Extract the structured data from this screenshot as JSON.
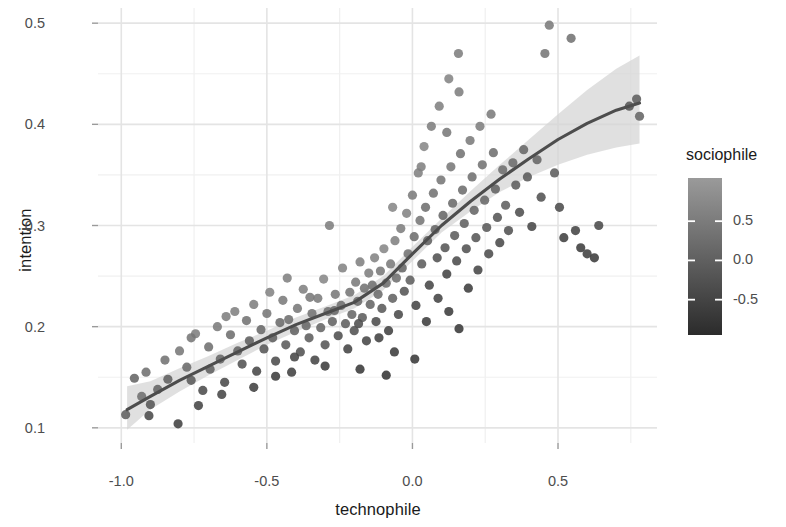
{
  "chart_data": {
    "type": "scatter",
    "title": "",
    "xlabel": "technophile",
    "ylabel": "intention",
    "xlim": [
      -1.08,
      0.84
    ],
    "ylim": [
      0.085,
      0.515
    ],
    "grid": true,
    "x_ticks": [
      -1.0,
      -0.5,
      0.0,
      0.5
    ],
    "x_tick_labels": [
      "-1.0",
      "-0.5",
      "0.0",
      "0.5"
    ],
    "y_ticks": [
      0.1,
      0.2,
      0.3,
      0.4,
      0.5
    ],
    "y_tick_labels": [
      "0.1",
      "0.2",
      "0.3",
      "0.4",
      "0.5"
    ],
    "x_minor_ticks": [
      -0.75,
      -0.25,
      0.25,
      0.75
    ],
    "y_minor_ticks": [
      0.15,
      0.25,
      0.35,
      0.45
    ],
    "legend": {
      "title": "sociophile",
      "position": "right",
      "type": "colorbar",
      "ticks": [
        0.5,
        0.0,
        -0.5
      ],
      "tick_labels": [
        "0.5",
        "0.0",
        "-0.5"
      ],
      "range": [
        -0.95,
        1.05
      ],
      "color_low": "#2b2b2b",
      "color_high": "#9a9a9a"
    },
    "point_color_default": "#6e6e6e",
    "trend_line_color": "#4d4d4d",
    "confidence_band_color": "#d4d4d4",
    "trend_line": {
      "x": [
        -0.98,
        -0.9,
        -0.8,
        -0.7,
        -0.6,
        -0.5,
        -0.4,
        -0.3,
        -0.2,
        -0.1,
        0.0,
        0.1,
        0.2,
        0.3,
        0.4,
        0.5,
        0.6,
        0.7,
        0.78
      ],
      "y": [
        0.118,
        0.131,
        0.147,
        0.161,
        0.175,
        0.189,
        0.202,
        0.213,
        0.224,
        0.243,
        0.272,
        0.3,
        0.324,
        0.346,
        0.366,
        0.385,
        0.401,
        0.414,
        0.421
      ],
      "ci_lower": [
        0.098,
        0.118,
        0.136,
        0.152,
        0.167,
        0.182,
        0.195,
        0.207,
        0.218,
        0.236,
        0.265,
        0.293,
        0.314,
        0.333,
        0.348,
        0.36,
        0.37,
        0.377,
        0.381
      ],
      "ci_upper": [
        0.141,
        0.146,
        0.159,
        0.171,
        0.184,
        0.196,
        0.209,
        0.22,
        0.231,
        0.25,
        0.279,
        0.307,
        0.334,
        0.36,
        0.385,
        0.41,
        0.434,
        0.455,
        0.468
      ]
    },
    "points": [
      {
        "x": -0.985,
        "y": 0.113,
        "c": -0.05
      },
      {
        "x": -0.955,
        "y": 0.149,
        "c": 0.1
      },
      {
        "x": -0.93,
        "y": 0.131,
        "c": 0.25
      },
      {
        "x": -0.9,
        "y": 0.123,
        "c": -0.2
      },
      {
        "x": -0.875,
        "y": 0.138,
        "c": 0.05
      },
      {
        "x": -0.85,
        "y": 0.167,
        "c": 0.35
      },
      {
        "x": -0.84,
        "y": 0.148,
        "c": 0.0
      },
      {
        "x": -0.805,
        "y": 0.104,
        "c": -0.55
      },
      {
        "x": -0.8,
        "y": 0.176,
        "c": 0.45
      },
      {
        "x": -0.775,
        "y": 0.16,
        "c": 0.2
      },
      {
        "x": -0.76,
        "y": 0.147,
        "c": -0.1
      },
      {
        "x": -0.745,
        "y": 0.193,
        "c": 0.55
      },
      {
        "x": -0.72,
        "y": 0.137,
        "c": -0.35
      },
      {
        "x": -0.7,
        "y": 0.18,
        "c": 0.3
      },
      {
        "x": -0.695,
        "y": 0.158,
        "c": 0.0
      },
      {
        "x": -0.67,
        "y": 0.2,
        "c": 0.5
      },
      {
        "x": -0.66,
        "y": 0.168,
        "c": 0.1
      },
      {
        "x": -0.645,
        "y": 0.145,
        "c": -0.4
      },
      {
        "x": -0.625,
        "y": 0.192,
        "c": 0.25
      },
      {
        "x": -0.61,
        "y": 0.215,
        "c": 0.6
      },
      {
        "x": -0.6,
        "y": 0.176,
        "c": 0.05
      },
      {
        "x": -0.585,
        "y": 0.163,
        "c": -0.25
      },
      {
        "x": -0.57,
        "y": 0.206,
        "c": 0.35
      },
      {
        "x": -0.56,
        "y": 0.186,
        "c": 0.0
      },
      {
        "x": -0.545,
        "y": 0.222,
        "c": 0.55
      },
      {
        "x": -0.535,
        "y": 0.156,
        "c": -0.45
      },
      {
        "x": -0.52,
        "y": 0.197,
        "c": 0.15
      },
      {
        "x": -0.51,
        "y": 0.178,
        "c": -0.15
      },
      {
        "x": -0.5,
        "y": 0.213,
        "c": 0.4
      },
      {
        "x": -0.49,
        "y": 0.234,
        "c": 0.65
      },
      {
        "x": -0.48,
        "y": 0.189,
        "c": 0.0
      },
      {
        "x": -0.47,
        "y": 0.166,
        "c": -0.35
      },
      {
        "x": -0.455,
        "y": 0.204,
        "c": 0.2
      },
      {
        "x": -0.445,
        "y": 0.226,
        "c": 0.5
      },
      {
        "x": -0.435,
        "y": 0.182,
        "c": -0.1
      },
      {
        "x": -0.425,
        "y": 0.207,
        "c": 0.25
      },
      {
        "x": -0.415,
        "y": 0.155,
        "c": -0.55
      },
      {
        "x": -0.405,
        "y": 0.196,
        "c": 0.05
      },
      {
        "x": -0.395,
        "y": 0.218,
        "c": 0.45
      },
      {
        "x": -0.385,
        "y": 0.175,
        "c": -0.25
      },
      {
        "x": -0.375,
        "y": 0.237,
        "c": 0.6
      },
      {
        "x": -0.365,
        "y": 0.201,
        "c": 0.15
      },
      {
        "x": -0.355,
        "y": 0.189,
        "c": -0.05
      },
      {
        "x": -0.345,
        "y": 0.213,
        "c": 0.35
      },
      {
        "x": -0.335,
        "y": 0.167,
        "c": -0.45
      },
      {
        "x": -0.325,
        "y": 0.228,
        "c": 0.5
      },
      {
        "x": -0.315,
        "y": 0.199,
        "c": 0.1
      },
      {
        "x": -0.305,
        "y": 0.247,
        "c": 0.7
      },
      {
        "x": -0.3,
        "y": 0.182,
        "c": -0.2
      },
      {
        "x": -0.29,
        "y": 0.215,
        "c": 0.3
      },
      {
        "x": -0.285,
        "y": 0.3,
        "c": 0.55
      },
      {
        "x": -0.275,
        "y": 0.205,
        "c": 0.05
      },
      {
        "x": -0.265,
        "y": 0.232,
        "c": 0.45
      },
      {
        "x": -0.255,
        "y": 0.191,
        "c": -0.3
      },
      {
        "x": -0.245,
        "y": 0.221,
        "c": 0.25
      },
      {
        "x": -0.24,
        "y": 0.258,
        "c": 0.65
      },
      {
        "x": -0.23,
        "y": 0.203,
        "c": 0.0
      },
      {
        "x": -0.222,
        "y": 0.178,
        "c": -0.5
      },
      {
        "x": -0.215,
        "y": 0.234,
        "c": 0.4
      },
      {
        "x": -0.208,
        "y": 0.212,
        "c": 0.15
      },
      {
        "x": -0.2,
        "y": 0.196,
        "c": -0.25
      },
      {
        "x": -0.195,
        "y": 0.244,
        "c": 0.5
      },
      {
        "x": -0.188,
        "y": 0.225,
        "c": 0.2
      },
      {
        "x": -0.18,
        "y": 0.264,
        "c": 0.6
      },
      {
        "x": -0.172,
        "y": 0.209,
        "c": -0.05
      },
      {
        "x": -0.165,
        "y": 0.238,
        "c": 0.35
      },
      {
        "x": -0.158,
        "y": 0.186,
        "c": -0.45
      },
      {
        "x": -0.15,
        "y": 0.253,
        "c": 0.55
      },
      {
        "x": -0.145,
        "y": 0.222,
        "c": 0.1
      },
      {
        "x": -0.138,
        "y": 0.241,
        "c": 0.3
      },
      {
        "x": -0.13,
        "y": 0.268,
        "c": 0.65
      },
      {
        "x": -0.125,
        "y": 0.205,
        "c": -0.35
      },
      {
        "x": -0.118,
        "y": 0.232,
        "c": 0.2
      },
      {
        "x": -0.11,
        "y": 0.255,
        "c": 0.45
      },
      {
        "x": -0.105,
        "y": 0.218,
        "c": -0.1
      },
      {
        "x": -0.098,
        "y": 0.277,
        "c": 0.7
      },
      {
        "x": -0.09,
        "y": 0.243,
        "c": 0.25
      },
      {
        "x": -0.082,
        "y": 0.196,
        "c": -0.55
      },
      {
        "x": -0.075,
        "y": 0.262,
        "c": 0.5
      },
      {
        "x": -0.068,
        "y": 0.228,
        "c": 0.05
      },
      {
        "x": -0.06,
        "y": 0.285,
        "c": 0.6
      },
      {
        "x": -0.055,
        "y": 0.248,
        "c": 0.3
      },
      {
        "x": -0.048,
        "y": 0.212,
        "c": -0.4
      },
      {
        "x": -0.04,
        "y": 0.297,
        "c": 0.55
      },
      {
        "x": -0.035,
        "y": 0.258,
        "c": 0.15
      },
      {
        "x": -0.028,
        "y": 0.235,
        "c": -0.2
      },
      {
        "x": -0.02,
        "y": 0.312,
        "c": 0.65
      },
      {
        "x": -0.015,
        "y": 0.272,
        "c": 0.35
      },
      {
        "x": -0.008,
        "y": 0.246,
        "c": 0.0
      },
      {
        "x": 0.0,
        "y": 0.33,
        "c": 0.5
      },
      {
        "x": 0.006,
        "y": 0.289,
        "c": 0.25
      },
      {
        "x": 0.012,
        "y": 0.221,
        "c": -0.5
      },
      {
        "x": 0.02,
        "y": 0.352,
        "c": 0.6
      },
      {
        "x": 0.026,
        "y": 0.305,
        "c": 0.4
      },
      {
        "x": 0.032,
        "y": 0.262,
        "c": -0.05
      },
      {
        "x": 0.04,
        "y": 0.378,
        "c": 0.7
      },
      {
        "x": 0.045,
        "y": 0.318,
        "c": 0.3
      },
      {
        "x": 0.052,
        "y": 0.285,
        "c": 0.05
      },
      {
        "x": 0.058,
        "y": 0.241,
        "c": -0.45
      },
      {
        "x": 0.065,
        "y": 0.398,
        "c": 0.55
      },
      {
        "x": 0.072,
        "y": 0.332,
        "c": 0.35
      },
      {
        "x": 0.078,
        "y": 0.296,
        "c": 0.1
      },
      {
        "x": 0.085,
        "y": 0.268,
        "c": -0.25
      },
      {
        "x": 0.092,
        "y": 0.418,
        "c": 0.6
      },
      {
        "x": 0.098,
        "y": 0.345,
        "c": 0.4
      },
      {
        "x": 0.105,
        "y": 0.31,
        "c": 0.15
      },
      {
        "x": 0.112,
        "y": 0.278,
        "c": -0.15
      },
      {
        "x": 0.118,
        "y": 0.252,
        "c": -0.5
      },
      {
        "x": 0.125,
        "y": 0.445,
        "c": 0.65
      },
      {
        "x": 0.132,
        "y": 0.358,
        "c": 0.45
      },
      {
        "x": 0.138,
        "y": 0.322,
        "c": 0.2
      },
      {
        "x": 0.145,
        "y": 0.29,
        "c": -0.05
      },
      {
        "x": 0.152,
        "y": 0.265,
        "c": -0.35
      },
      {
        "x": 0.158,
        "y": 0.47,
        "c": 0.55
      },
      {
        "x": 0.165,
        "y": 0.371,
        "c": 0.35
      },
      {
        "x": 0.172,
        "y": 0.335,
        "c": 0.25
      },
      {
        "x": 0.178,
        "y": 0.302,
        "c": 0.0
      },
      {
        "x": 0.185,
        "y": 0.277,
        "c": -0.25
      },
      {
        "x": 0.192,
        "y": 0.238,
        "c": -0.6
      },
      {
        "x": 0.198,
        "y": 0.384,
        "c": 0.5
      },
      {
        "x": 0.205,
        "y": 0.348,
        "c": 0.3
      },
      {
        "x": 0.212,
        "y": 0.315,
        "c": 0.1
      },
      {
        "x": 0.218,
        "y": 0.288,
        "c": -0.15
      },
      {
        "x": 0.225,
        "y": 0.256,
        "c": -0.45
      },
      {
        "x": 0.232,
        "y": 0.398,
        "c": 0.55
      },
      {
        "x": 0.24,
        "y": 0.36,
        "c": 0.35
      },
      {
        "x": 0.248,
        "y": 0.325,
        "c": 0.15
      },
      {
        "x": 0.255,
        "y": 0.298,
        "c": -0.1
      },
      {
        "x": 0.262,
        "y": 0.272,
        "c": -0.35
      },
      {
        "x": 0.27,
        "y": 0.41,
        "c": 0.5
      },
      {
        "x": 0.278,
        "y": 0.372,
        "c": 0.3
      },
      {
        "x": 0.285,
        "y": 0.336,
        "c": 0.05
      },
      {
        "x": 0.292,
        "y": 0.308,
        "c": -0.2
      },
      {
        "x": 0.3,
        "y": 0.283,
        "c": -0.4
      },
      {
        "x": 0.31,
        "y": 0.355,
        "c": 0.25
      },
      {
        "x": 0.32,
        "y": 0.32,
        "c": 0.0
      },
      {
        "x": 0.33,
        "y": 0.295,
        "c": -0.25
      },
      {
        "x": 0.345,
        "y": 0.362,
        "c": 0.2
      },
      {
        "x": 0.355,
        "y": 0.34,
        "c": -0.05
      },
      {
        "x": 0.368,
        "y": 0.313,
        "c": -0.3
      },
      {
        "x": 0.382,
        "y": 0.375,
        "c": 0.15
      },
      {
        "x": 0.395,
        "y": 0.348,
        "c": -0.1
      },
      {
        "x": 0.41,
        "y": 0.299,
        "c": -0.45
      },
      {
        "x": 0.428,
        "y": 0.365,
        "c": 0.1
      },
      {
        "x": 0.442,
        "y": 0.328,
        "c": -0.25
      },
      {
        "x": 0.455,
        "y": 0.47,
        "c": 0.4
      },
      {
        "x": 0.47,
        "y": 0.498,
        "c": 0.5
      },
      {
        "x": 0.488,
        "y": 0.352,
        "c": -0.05
      },
      {
        "x": 0.505,
        "y": 0.318,
        "c": -0.35
      },
      {
        "x": 0.52,
        "y": 0.288,
        "c": -0.55
      },
      {
        "x": 0.545,
        "y": 0.485,
        "c": 0.35
      },
      {
        "x": 0.56,
        "y": 0.295,
        "c": -0.5
      },
      {
        "x": 0.578,
        "y": 0.278,
        "c": -0.6
      },
      {
        "x": 0.6,
        "y": 0.272,
        "c": -0.55
      },
      {
        "x": 0.625,
        "y": 0.268,
        "c": -0.65
      },
      {
        "x": 0.64,
        "y": 0.3,
        "c": -0.4
      },
      {
        "x": 0.745,
        "y": 0.418,
        "c": -0.15
      },
      {
        "x": 0.77,
        "y": 0.425,
        "c": -0.05
      },
      {
        "x": 0.78,
        "y": 0.408,
        "c": 0.1
      },
      {
        "x": -0.915,
        "y": 0.155,
        "c": 0.3
      },
      {
        "x": -0.76,
        "y": 0.189,
        "c": 0.4
      },
      {
        "x": -0.64,
        "y": 0.21,
        "c": 0.55
      },
      {
        "x": -0.43,
        "y": 0.248,
        "c": 0.6
      },
      {
        "x": -0.352,
        "y": 0.229,
        "c": 0.45
      },
      {
        "x": -0.268,
        "y": 0.216,
        "c": 0.15
      },
      {
        "x": -0.185,
        "y": 0.203,
        "c": -0.3
      },
      {
        "x": -0.115,
        "y": 0.189,
        "c": -0.55
      },
      {
        "x": -0.062,
        "y": 0.175,
        "c": -0.65
      },
      {
        "x": 0.008,
        "y": 0.168,
        "c": -0.7
      },
      {
        "x": 0.048,
        "y": 0.205,
        "c": -0.6
      },
      {
        "x": 0.088,
        "y": 0.228,
        "c": -0.5
      },
      {
        "x": -0.905,
        "y": 0.112,
        "c": -0.4
      },
      {
        "x": -0.545,
        "y": 0.14,
        "c": -0.55
      },
      {
        "x": -0.47,
        "y": 0.151,
        "c": -0.6
      },
      {
        "x": -0.405,
        "y": 0.17,
        "c": -0.45
      },
      {
        "x": -0.3,
        "y": 0.161,
        "c": -0.65
      },
      {
        "x": -0.18,
        "y": 0.158,
        "c": -0.7
      },
      {
        "x": -0.09,
        "y": 0.152,
        "c": -0.75
      },
      {
        "x": 0.125,
        "y": 0.215,
        "c": -0.65
      },
      {
        "x": 0.16,
        "y": 0.198,
        "c": -0.7
      },
      {
        "x": -0.735,
        "y": 0.122,
        "c": -0.5
      },
      {
        "x": -0.655,
        "y": 0.133,
        "c": -0.45
      },
      {
        "x": -0.068,
        "y": 0.318,
        "c": 0.7
      },
      {
        "x": 0.118,
        "y": 0.392,
        "c": 0.45
      },
      {
        "x": 0.16,
        "y": 0.432,
        "c": 0.55
      },
      {
        "x": 0.03,
        "y": 0.358,
        "c": 0.6
      }
    ]
  }
}
